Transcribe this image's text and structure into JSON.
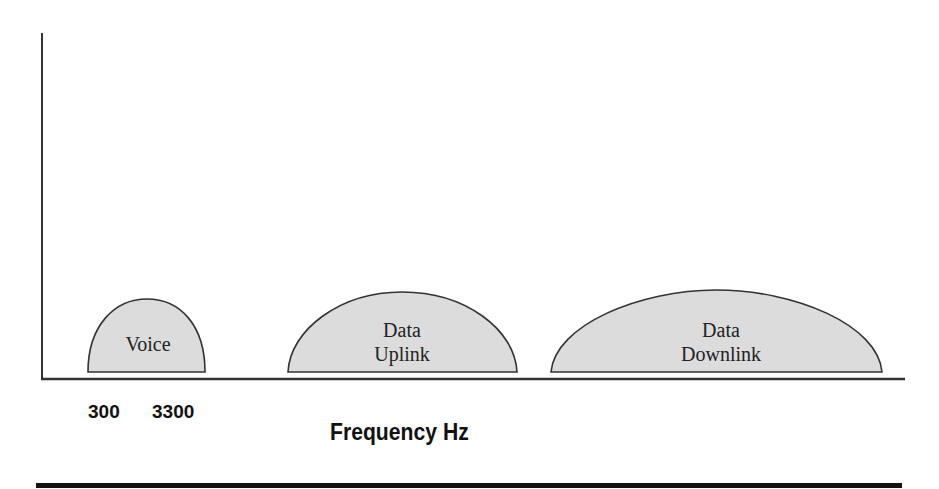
{
  "diagram": {
    "type": "frequency-spectrum",
    "bands": [
      {
        "label_lines": [
          "Voice"
        ],
        "fill": "#dcdcdc"
      },
      {
        "label_lines": [
          "Data",
          "Uplink"
        ],
        "fill": "#dcdcdc"
      },
      {
        "label_lines": [
          "Data",
          "Downlink"
        ],
        "fill": "#dcdcdc"
      }
    ],
    "tick_labels": [
      "300",
      "3300"
    ],
    "x_axis_title": "Frequency Hz",
    "colors": {
      "stroke": "#333333",
      "band_fill": "#dcdcdc",
      "rule": "#111111"
    }
  }
}
